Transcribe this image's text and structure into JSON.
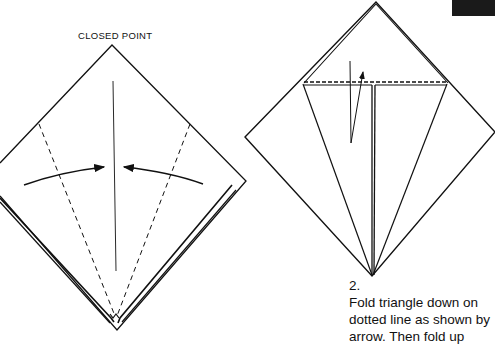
{
  "figure": {
    "left_panel": {
      "label": "CLOSED POINT"
    },
    "right_panel": {
      "step_number": "2.",
      "instruction_lines": [
        "Fold triangle down on",
        "dotted line as shown by",
        "arrow. Then fold up"
      ]
    },
    "colors": {
      "line": "#111111",
      "tab": "#1a1a1a",
      "background": "#ffffff"
    }
  }
}
